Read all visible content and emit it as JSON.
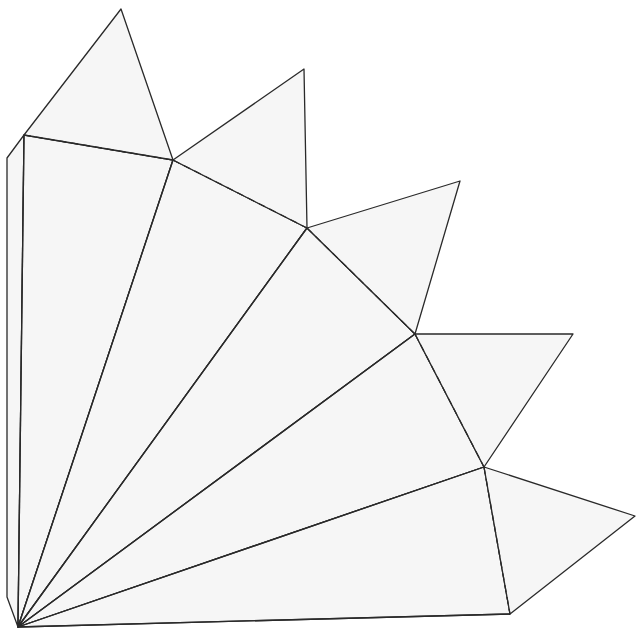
{
  "diagram": {
    "type": "paper-net",
    "colors": {
      "background": "#ffffff",
      "face_fill": "#f6f6f6",
      "stroke": "#2a2a2a"
    },
    "apex": [
      18,
      627
    ],
    "glue_strip": [
      [
        7,
        158
      ],
      [
        24,
        135
      ],
      [
        18,
        627
      ],
      [
        7,
        597
      ]
    ],
    "base_points": [
      [
        24,
        135
      ],
      [
        173,
        160
      ],
      [
        307,
        228
      ],
      [
        415,
        334
      ],
      [
        484,
        467
      ],
      [
        510,
        614
      ]
    ],
    "tab_tips": [
      [
        121,
        9
      ],
      [
        304,
        69
      ],
      [
        460,
        181
      ],
      [
        573,
        334
      ],
      [
        635,
        516
      ]
    ],
    "fold_lines_style": "dashed",
    "cut_lines_style": "solid"
  }
}
